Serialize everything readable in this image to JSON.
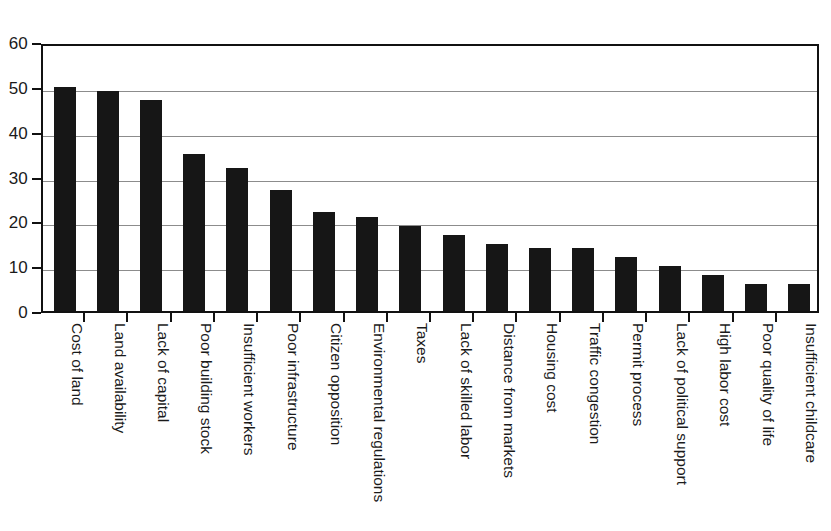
{
  "chart_data": {
    "type": "bar",
    "title": "",
    "subtitle": "",
    "xlabel": "",
    "ylabel": "",
    "ylim": [
      0,
      60
    ],
    "yticks": [
      0,
      10,
      20,
      30,
      40,
      50,
      60
    ],
    "ytick_labels": [
      "0",
      "10",
      "20",
      "30",
      "40",
      "50",
      "60"
    ],
    "grid": true,
    "grid_axis": "y",
    "legend": false,
    "legend_position": "none",
    "orientation": "vertical",
    "bar_color": "#161616",
    "background_color": "#ffffff",
    "gridline_color": "#8c8c8c",
    "axis_color": "#111111",
    "xtick_label_rotation": 90,
    "categories": [
      "Cost of land",
      "Land availability",
      "Lack of capital",
      "Poor building stock",
      "Insufficient workers",
      "Poor infrastructure",
      "Citizen opposition",
      "Environmental regulations",
      "Taxes",
      "Lack of skilled labor",
      "Distance from markets",
      "Housing cost",
      "Traffic congestion",
      "Permit process",
      "Lack of political support",
      "High labor cost",
      "Poor quality of life",
      "Insufficient childcare"
    ],
    "values": [
      50,
      49,
      47,
      35,
      32,
      27,
      22,
      21,
      19,
      17,
      15,
      14,
      14,
      12,
      10,
      8,
      6,
      6
    ]
  }
}
